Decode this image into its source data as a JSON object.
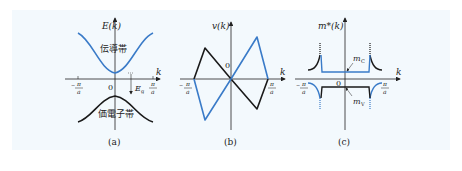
{
  "figure": {
    "background": "#f3f9fd",
    "colors": {
      "conduction": "#3a7bc8",
      "valence": "#1a1a1a",
      "axis": "#222222"
    },
    "panels": [
      {
        "id": "a",
        "caption": "(a)",
        "y_axis_label": "E(k)",
        "x_axis_label": "k",
        "origin_label": "0",
        "tick_left": {
          "num": "π",
          "den": "a",
          "sign": "−"
        },
        "tick_right": {
          "num": "π",
          "den": "a"
        },
        "conduction_band_label": "伝導帯",
        "valence_band_label": "価電子帯",
        "gap_label": "E",
        "gap_subscript": "g"
      },
      {
        "id": "b",
        "caption": "(b)",
        "y_axis_label": "v(k)",
        "x_axis_label": "k",
        "origin_label": "0",
        "tick_left": {
          "num": "π",
          "den": "a",
          "sign": "−"
        },
        "tick_right": {
          "num": "π",
          "den": "a"
        }
      },
      {
        "id": "c",
        "caption": "(c)",
        "y_axis_label": "m*(k)",
        "x_axis_label": "k",
        "origin_label": "0",
        "tick_left": {
          "num": "π",
          "den": "a",
          "sign": "−"
        },
        "tick_right": {
          "num": "π",
          "den": "a"
        },
        "mc_label": "m",
        "mc_sub": "C",
        "mv_label": "m",
        "mv_sub": "V"
      }
    ]
  }
}
